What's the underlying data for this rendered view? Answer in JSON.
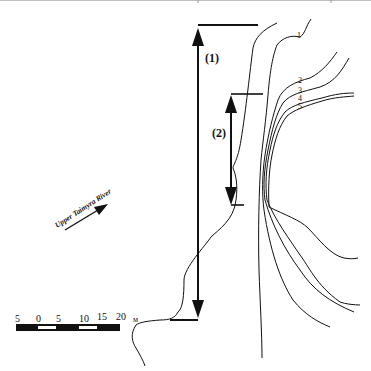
{
  "figure": {
    "top_border_color": "#bdbdbd",
    "line_color": "#111111",
    "labels": {
      "range_1": "(1)",
      "range_2": "(2)",
      "river": "Upper Taimyra River",
      "contours": [
        "1",
        "2",
        "3",
        "4",
        "5"
      ]
    },
    "scale_bar": {
      "ticks": [
        "5",
        "0",
        "5",
        "10",
        "15",
        "20"
      ],
      "unit": "м"
    }
  }
}
